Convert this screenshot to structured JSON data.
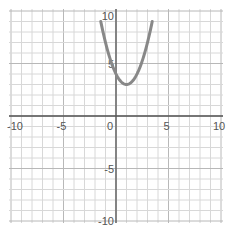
{
  "chart_data": {
    "type": "line",
    "title": "",
    "xlabel": "",
    "ylabel": "",
    "xlim": [
      -10,
      10
    ],
    "ylim": [
      -10,
      10
    ],
    "grid": true,
    "x_ticks": [
      -10,
      -5,
      0,
      5,
      10
    ],
    "y_ticks": [
      -10,
      -5,
      5,
      10
    ],
    "x_tick_labels": [
      "-10",
      "-5",
      "0",
      "5",
      "10"
    ],
    "y_tick_labels": [
      "-10",
      "-5",
      "5",
      "10"
    ],
    "series": [
      {
        "name": "parabola",
        "equation": "y = x^2 - 2x + 4",
        "vertex": [
          1,
          3
        ],
        "y_intercept": 4,
        "color": "#888888",
        "x": [
          -1.45,
          -1,
          -0.5,
          0,
          0.5,
          1,
          1.5,
          2,
          2.5,
          3,
          3.45
        ],
        "y": [
          10,
          7,
          5.25,
          4,
          3.25,
          3,
          3.25,
          4,
          5.25,
          7,
          10
        ]
      }
    ]
  },
  "colors": {
    "grid": "#d8d8d8",
    "axis": "#555555",
    "curve": "#888888"
  }
}
